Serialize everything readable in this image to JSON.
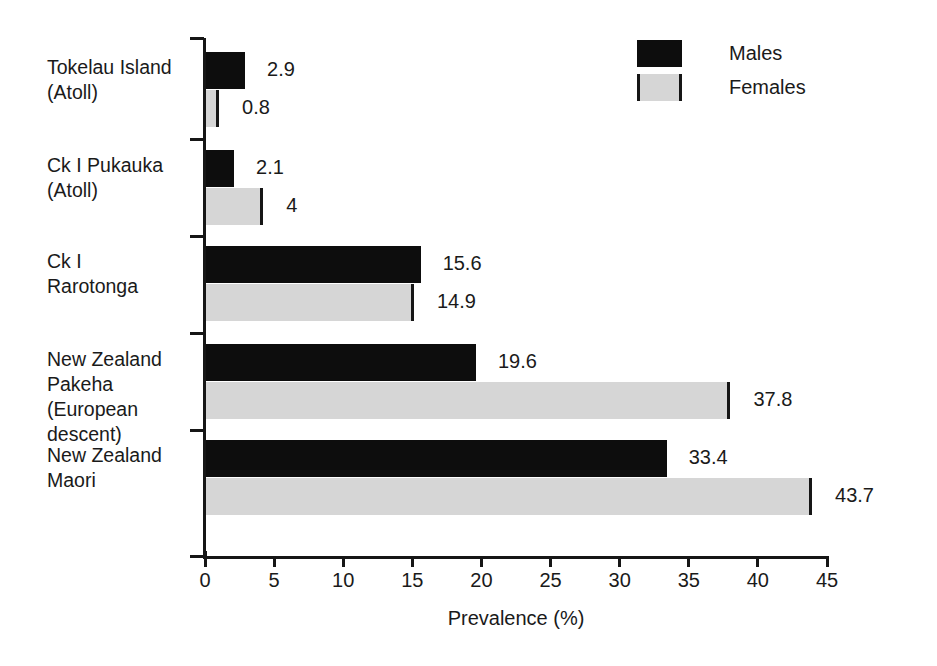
{
  "chart_data": {
    "type": "bar",
    "orientation": "horizontal",
    "title": "",
    "xlabel": "Prevalence (%)",
    "ylabel": "",
    "xlim": [
      0,
      45
    ],
    "xticks": [
      0,
      5,
      10,
      15,
      20,
      25,
      30,
      35,
      40,
      45
    ],
    "xtick_labels": [
      "0",
      "5",
      "10",
      "15",
      "20",
      "25",
      "30",
      "35",
      "40",
      "45"
    ],
    "grid": false,
    "legend_position": "top-right",
    "categories": [
      "Tokelau Island\n(Atoll)",
      "Ck I Pukauka\n(Atoll)",
      "Ck I\nRarotonga",
      "New Zealand\nPakeha\n(European\ndescent)",
      "New Zealand\nMaori"
    ],
    "series": [
      {
        "name": "Males",
        "color": "#0d0d0d",
        "values": [
          2.9,
          2.1,
          15.6,
          19.6,
          33.4
        ],
        "value_labels": [
          "2.9",
          "2.1",
          "15.6",
          "19.6",
          "33.4"
        ]
      },
      {
        "name": "Females",
        "color": "#d6d6d6",
        "values": [
          0.8,
          4,
          14.9,
          37.8,
          43.7
        ],
        "value_labels": [
          "0.8",
          "4",
          "14.9",
          "37.8",
          "43.7"
        ]
      }
    ]
  },
  "legend": {
    "items": [
      {
        "label": "Males",
        "swatch": "black-swatch"
      },
      {
        "label": "Females",
        "swatch": "grey-swatch"
      }
    ]
  },
  "axis": {
    "x_title": "Prevalence (%)"
  },
  "colors": {
    "males": "#0d0d0d",
    "females": "#d6d6d6",
    "axis": "#161616",
    "text": "#1a1a1a",
    "background": "#ffffff"
  }
}
